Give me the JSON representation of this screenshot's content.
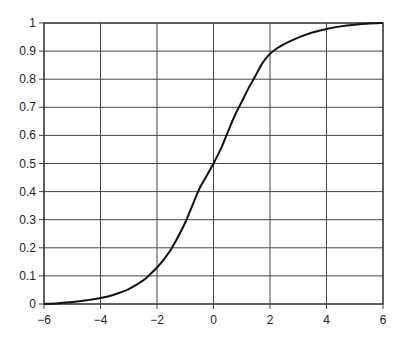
{
  "chart_data": {
    "type": "line",
    "title": "",
    "xlabel": "",
    "ylabel": "",
    "xlim": [
      -6,
      6
    ],
    "ylim": [
      0,
      1
    ],
    "grid": true,
    "legend": null,
    "x_ticks": [
      -6,
      -4,
      -2,
      0,
      2,
      4,
      6
    ],
    "x_tick_labels": [
      "−6",
      "−4",
      "−2",
      "0",
      "2",
      "4",
      "6"
    ],
    "y_ticks": [
      0,
      0.1,
      0.2,
      0.3,
      0.4,
      0.5,
      0.6,
      0.7,
      0.8,
      0.9,
      1
    ],
    "y_tick_labels": [
      "0",
      "0.1",
      "0.2",
      "0.3",
      "0.4",
      "0.5",
      "0.6",
      "0.7",
      "0.8",
      "0.9",
      "1"
    ],
    "series": [
      {
        "name": "S-curve",
        "color": "#111111",
        "x": [
          -6,
          -5.5,
          -5,
          -4.5,
          -4,
          -3.5,
          -3,
          -2.5,
          -2.25,
          -2,
          -1.75,
          -1.5,
          -1.25,
          -1,
          -0.75,
          -0.5,
          -0.25,
          0,
          0.25,
          0.5,
          0.75,
          1,
          1.25,
          1.5,
          1.75,
          2,
          2.25,
          2.5,
          3,
          3.5,
          4,
          4.5,
          5,
          5.5,
          6
        ],
        "y": [
          0.0,
          0.003,
          0.007,
          0.013,
          0.021,
          0.034,
          0.053,
          0.083,
          0.105,
          0.13,
          0.16,
          0.195,
          0.24,
          0.29,
          0.35,
          0.41,
          0.455,
          0.5,
          0.55,
          0.61,
          0.67,
          0.72,
          0.77,
          0.815,
          0.86,
          0.89,
          0.91,
          0.925,
          0.948,
          0.966,
          0.979,
          0.988,
          0.994,
          0.998,
          1.0
        ]
      }
    ]
  }
}
